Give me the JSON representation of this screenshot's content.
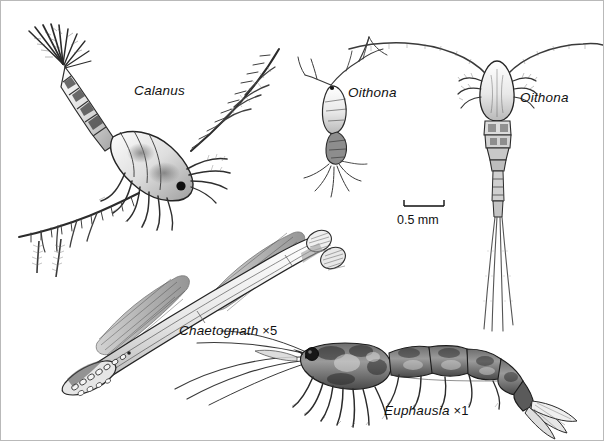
{
  "plate": {
    "background_color": "#ffffff",
    "ink_color": "#1a1a1a",
    "border_color": "#b9b9b9",
    "width": 604,
    "height": 441
  },
  "labels": [
    {
      "id": "calanus",
      "text": "Calanus",
      "magnification": ""
    },
    {
      "id": "oithona_side",
      "text": "Oithona",
      "magnification": ""
    },
    {
      "id": "oithona_dors",
      "text": "Oithona",
      "magnification": ""
    },
    {
      "id": "chaetognath",
      "text": "Chaetognath",
      "magnification": "×5"
    },
    {
      "id": "euphausia",
      "text": "Euphausia",
      "magnification": "×1"
    }
  ],
  "scale_bar": {
    "caption": "0.5 mm",
    "length_px": 40
  },
  "organisms": [
    {
      "name": "calanus-copepod",
      "common": "Calanus copepod, lateral, tail upper-left"
    },
    {
      "name": "oithona-lateral",
      "common": "Oithona copepod, small lateral view"
    },
    {
      "name": "oithona-dorsal",
      "common": "Oithona copepod, dorsal view with long antennae"
    },
    {
      "name": "chaetognath-arrowworm",
      "common": "Arrow worm, body angled up-right"
    },
    {
      "name": "euphausia-krill",
      "common": "Krill, lateral, head left"
    }
  ]
}
